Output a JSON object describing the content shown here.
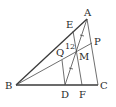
{
  "diagram": {
    "type": "geometry-figure",
    "points": {
      "A": {
        "label": "A",
        "x": 87,
        "y": 19
      },
      "B": {
        "label": "B",
        "x": 16,
        "y": 85
      },
      "C": {
        "label": "C",
        "x": 98,
        "y": 85
      },
      "D": {
        "label": "D",
        "x": 65,
        "y": 85
      },
      "F": {
        "label": "F",
        "x": 82,
        "y": 85
      },
      "E": {
        "label": "E",
        "x": 73,
        "y": 31
      },
      "P": {
        "label": "P",
        "x": 92,
        "y": 43
      },
      "M": {
        "label": "M",
        "x": 77,
        "y": 52
      },
      "Q": {
        "label": "Q",
        "x": 62,
        "y": 60
      }
    },
    "segments": [
      [
        "A",
        "B"
      ],
      [
        "B",
        "C"
      ],
      [
        "C",
        "A"
      ],
      [
        "B",
        "P"
      ],
      [
        "A",
        "D"
      ],
      [
        "E",
        "F"
      ],
      [
        "Q",
        "D"
      ]
    ],
    "annotations": {
      "angle_label": "12",
      "equal_ticks": [
        "AM",
        "MD"
      ]
    },
    "colors": {
      "stroke": "#3a3a3a",
      "text": "#2a2a2a",
      "background": "#ffffff"
    }
  }
}
